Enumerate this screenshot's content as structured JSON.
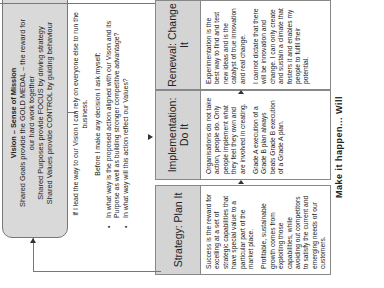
{
  "vision": {
    "title": "Vision – Sense of Mission",
    "lines": [
      "Shared Goals provide the GOLD MEDAL – the reward for",
      "our hard work together",
      "Shared Purposes provide FOCUS by driving strategy",
      "Shared Values provide CONTROL by guiding behaviour"
    ]
  },
  "middle": {
    "lead": "If I lead the way to our Vision I can rely on everyone else to run the business.",
    "ask": "Before I make any decision I ask myself:",
    "bullets": [
      "In what way is the proposed action aligned with our Vison and its Purpose as well as building stronger competitive advantage?",
      "In what way will this action reflect our Values?"
    ]
  },
  "columns": [
    {
      "title": "Strategy: Plan It",
      "paragraphs": [
        "Success is the reward for excelling at a set of strategic capabilities that have special value to a particular part of the market place.",
        "Profitable, sustainable growth comes from exploiting those capabilities, while avoiding out competitors to satisfy the current and emerging needs of our customers."
      ]
    },
    {
      "title": "Implementation: Do It",
      "paragraphs": [
        "Organisations do not take action, people do. Only people implement what they feel they own and are involved in creating.",
        "Grade A execution of a Grade B plan always beats Grade B execution of a Grade A plan."
      ]
    },
    {
      "title": "Renewal: Change It",
      "paragraphs": [
        "Experimentation is the best way to find and test new ideas and is the catalyst of true innovation and real change.",
        "I cannot dictate that there will be innovation and change. I can only create and sustain a climate that fosters it and enables my people to fulfil their potential."
      ]
    }
  ],
  "caption": "Make it happen... Will",
  "colors": {
    "box_fill": "#d9d9d9",
    "header_fill": "#d4d4d4",
    "line": "#777777"
  }
}
